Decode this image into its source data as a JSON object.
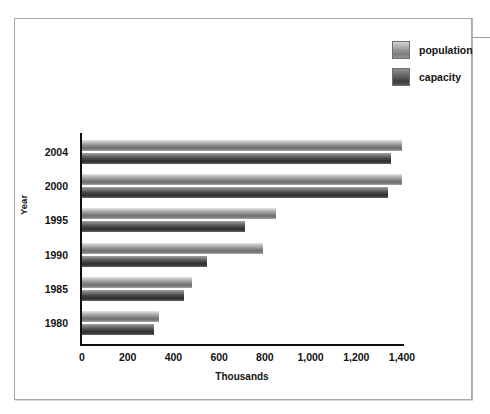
{
  "chart_data": {
    "type": "bar",
    "orientation": "horizontal",
    "title": "",
    "xlabel": "Thousands",
    "ylabel": "Year",
    "categories": [
      "2004",
      "2000",
      "1995",
      "1990",
      "1985",
      "1980"
    ],
    "series": [
      {
        "name": "population",
        "values": [
          1400,
          1400,
          850,
          790,
          480,
          335
        ]
      },
      {
        "name": "capacity",
        "values": [
          1350,
          1340,
          715,
          545,
          445,
          315
        ]
      }
    ],
    "xlim": [
      0,
      1400
    ],
    "xticks": [
      0,
      200,
      400,
      600,
      800,
      1000,
      1200,
      1400
    ],
    "xticklabels": [
      "0",
      "200",
      "400",
      "600",
      "800",
      "1,000",
      "1,200",
      "1,400"
    ],
    "grid": false,
    "legend_position": "top-right",
    "colors": {
      "population": "#8f8f8f",
      "capacity": "#3d3d3d",
      "axis": "#111111",
      "frame": "#a9a9a9"
    }
  },
  "legend": {
    "items": [
      {
        "label": "population",
        "swatch": "population-swatch"
      },
      {
        "label": "capacity",
        "swatch": "capacity-swatch"
      }
    ]
  },
  "axes": {
    "y_title": "Year",
    "x_title": "Thousands"
  }
}
